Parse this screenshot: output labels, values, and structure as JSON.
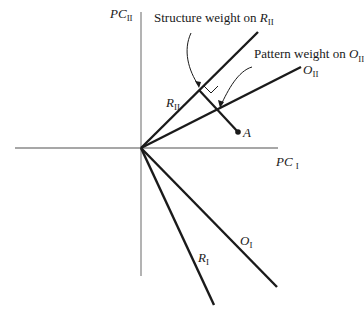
{
  "axes": {
    "x_label": "PC",
    "x_sub": "I",
    "y_label": "PC",
    "y_sub": "II"
  },
  "vectors": {
    "r2": {
      "label": "R",
      "sub": "II"
    },
    "o2": {
      "label": "O",
      "sub": "II"
    },
    "r1": {
      "label": "R",
      "sub": "I"
    },
    "o1": {
      "label": "O",
      "sub": "I"
    }
  },
  "point": {
    "label": "A"
  },
  "annotations": {
    "structure": {
      "text": "Structure weight on ",
      "var": "R",
      "sub": "II"
    },
    "pattern": {
      "text": "Pattern weight on ",
      "var": "O",
      "sub": "II"
    }
  },
  "colors": {
    "axis": "#8a8a8a",
    "line": "#1a1a1a",
    "background": "#ffffff"
  }
}
